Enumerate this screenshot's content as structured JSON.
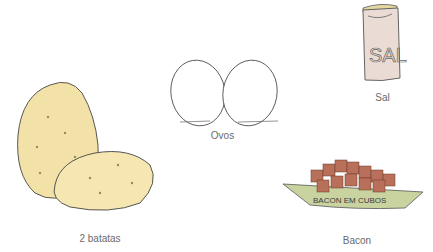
{
  "ingredients": [
    {
      "name": "Sal",
      "icon": "salt-bag-icon",
      "package_text": "SAL"
    },
    {
      "name": "Ovos",
      "icon": "eggs-icon"
    },
    {
      "name": "2 batatas",
      "icon": "potatoes-icon"
    },
    {
      "name": "Bacon",
      "icon": "bacon-cubes-icon",
      "package_text": "BACON EM CUBOS"
    }
  ],
  "colors": {
    "potato": "#f3e2a8",
    "potato_shade": "#e8c77a",
    "salt_bag": "#e9dcd2",
    "bacon": "#b9705a",
    "bacon_tray": "#c9d3a0",
    "label": "#6a6a6a"
  }
}
